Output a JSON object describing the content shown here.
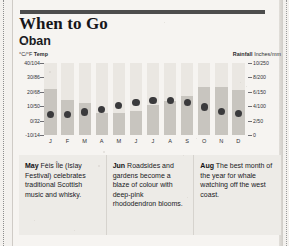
{
  "header": {
    "title": "When to Go",
    "place": "Oban"
  },
  "axis_captions": {
    "left_bold": "Temp",
    "left_units": "°C/°F",
    "right_bold": "Rainfall",
    "right_units": "Inches/mm"
  },
  "chart_data": {
    "type": "bar",
    "title": "Oban",
    "subtitle": "When to Go",
    "xlabel": "",
    "ylabel": "°C/°F Temp",
    "y2label": "Rainfall Inches/mm",
    "grid": false,
    "legend": "none",
    "categories": [
      "J",
      "F",
      "M",
      "A",
      "M",
      "J",
      "J",
      "A",
      "S",
      "O",
      "N",
      "D"
    ],
    "months_full": [
      "January",
      "February",
      "March",
      "April",
      "May",
      "June",
      "July",
      "August",
      "September",
      "October",
      "November",
      "December"
    ],
    "ylim": [
      -10,
      40
    ],
    "yticks": [
      40,
      30,
      20,
      10,
      0,
      -10
    ],
    "ytick_labels": [
      "40/104",
      "30/86",
      "20/68",
      "10/50",
      "0/32",
      "-10/14"
    ],
    "y2lim": [
      0,
      10
    ],
    "y2ticks": [
      10,
      8,
      6,
      4,
      2,
      0
    ],
    "y2tick_labels": [
      "10/250",
      "8/200",
      "6/150",
      "4/100",
      "2/50",
      "0"
    ],
    "series": [
      {
        "name": "Rainfall",
        "type": "bar",
        "units": "inches",
        "axis": "y2",
        "values": [
          6.4,
          4.9,
          4.4,
          3.1,
          3.0,
          3.4,
          4.2,
          4.7,
          5.4,
          6.6,
          6.6,
          6.2
        ]
      },
      {
        "name": "Temp",
        "type": "scatter",
        "units": "°C",
        "axis": "y",
        "values": [
          4.5,
          4.5,
          6.0,
          7.5,
          10.5,
          12.5,
          14.0,
          14.0,
          12.5,
          9.5,
          6.5,
          5.0
        ]
      }
    ]
  },
  "notes": [
    {
      "month": "May",
      "text": " Fèis Île (Islay Festival) celebrates traditional Scottish music and whisky."
    },
    {
      "month": "Jun",
      "text": " Roadsides and gardens become a blaze of colour with deep-pink rhododendron blooms."
    },
    {
      "month": "Aug",
      "text": " The best month of the year for whale watching off the west coast."
    }
  ],
  "colors": {
    "bar": "#c8c5bf",
    "column_bg": "#eae7e2",
    "dot": "#3a3a3c",
    "rule": "#4d4d4d",
    "paper": "#f6f4f1",
    "panel": "#edebe7"
  }
}
